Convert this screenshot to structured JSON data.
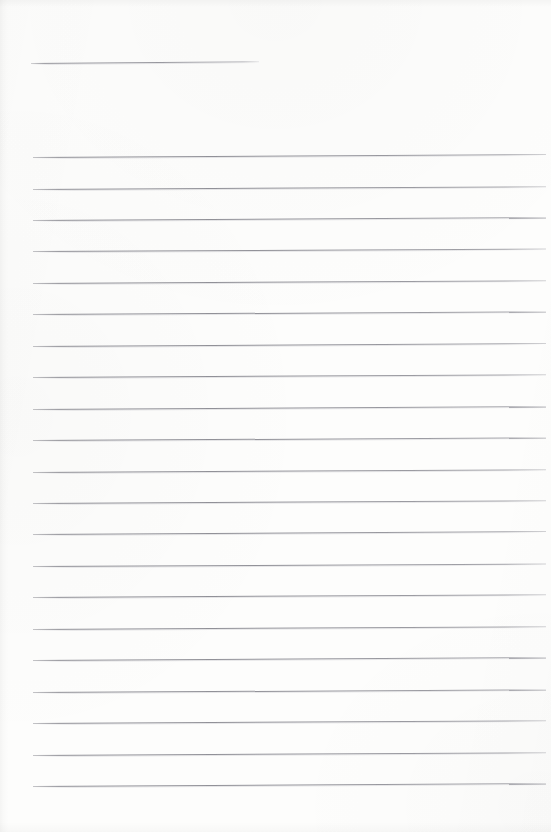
{
  "document": {
    "kind": "lined-notepad-page",
    "description": "Blank ruled notepad page, scanned",
    "page_width": 551,
    "page_height": 832,
    "background_color": "#fdfdfc",
    "rule_color": "#8f8f96",
    "text_content": "",
    "title_line_text": "",
    "has_handwriting": false
  },
  "title_rule": {
    "label": "title-rule",
    "x": 31,
    "y": 63,
    "width": 228,
    "rotate_deg": -0.45
  },
  "ruled_lines": {
    "count": 21,
    "left_x": 33,
    "right_x": 546,
    "first_y": 157,
    "spacing": 31.45,
    "items": [
      {
        "index": 1,
        "y": 157.0,
        "x": 33,
        "width": 513,
        "rotate_deg": -0.33,
        "text": ""
      },
      {
        "index": 2,
        "y": 188.5,
        "x": 33,
        "width": 513,
        "rotate_deg": -0.3,
        "text": ""
      },
      {
        "index": 3,
        "y": 219.9,
        "x": 33,
        "width": 513,
        "rotate_deg": -0.32,
        "text": ""
      },
      {
        "index": 4,
        "y": 251.4,
        "x": 33,
        "width": 513,
        "rotate_deg": -0.28,
        "text": ""
      },
      {
        "index": 5,
        "y": 282.8,
        "x": 33,
        "width": 513,
        "rotate_deg": -0.31,
        "text": ""
      },
      {
        "index": 6,
        "y": 314.3,
        "x": 33,
        "width": 513,
        "rotate_deg": -0.29,
        "text": ""
      },
      {
        "index": 7,
        "y": 345.7,
        "x": 33,
        "width": 513,
        "rotate_deg": -0.33,
        "text": ""
      },
      {
        "index": 8,
        "y": 377.2,
        "x": 33,
        "width": 513,
        "rotate_deg": -0.3,
        "text": ""
      },
      {
        "index": 9,
        "y": 408.6,
        "x": 33,
        "width": 513,
        "rotate_deg": -0.32,
        "text": ""
      },
      {
        "index": 10,
        "y": 440.1,
        "x": 33,
        "width": 513,
        "rotate_deg": -0.29,
        "text": ""
      },
      {
        "index": 11,
        "y": 471.5,
        "x": 33,
        "width": 513,
        "rotate_deg": -0.31,
        "text": ""
      },
      {
        "index": 12,
        "y": 503.0,
        "x": 33,
        "width": 513,
        "rotate_deg": -0.3,
        "text": ""
      },
      {
        "index": 13,
        "y": 534.4,
        "x": 33,
        "width": 513,
        "rotate_deg": -0.33,
        "text": ""
      },
      {
        "index": 14,
        "y": 565.9,
        "x": 33,
        "width": 513,
        "rotate_deg": -0.28,
        "text": ""
      },
      {
        "index": 15,
        "y": 597.3,
        "x": 33,
        "width": 513,
        "rotate_deg": -0.31,
        "text": ""
      },
      {
        "index": 16,
        "y": 628.8,
        "x": 33,
        "width": 513,
        "rotate_deg": -0.3,
        "text": ""
      },
      {
        "index": 17,
        "y": 660.2,
        "x": 33,
        "width": 513,
        "rotate_deg": -0.32,
        "text": ""
      },
      {
        "index": 18,
        "y": 691.7,
        "x": 33,
        "width": 513,
        "rotate_deg": -0.29,
        "text": ""
      },
      {
        "index": 19,
        "y": 723.1,
        "x": 33,
        "width": 513,
        "rotate_deg": -0.31,
        "text": ""
      },
      {
        "index": 20,
        "y": 754.6,
        "x": 33,
        "width": 513,
        "rotate_deg": -0.3,
        "text": ""
      },
      {
        "index": 21,
        "y": 786.0,
        "x": 33,
        "width": 513,
        "rotate_deg": -0.32,
        "text": ""
      }
    ]
  }
}
